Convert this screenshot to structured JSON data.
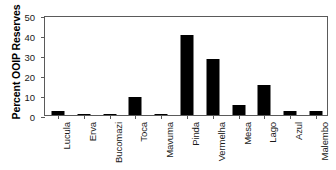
{
  "chart_data": {
    "type": "bar",
    "title": "",
    "xlabel": "",
    "ylabel": "Percent OOIP Reserves",
    "ylim": [
      0,
      50
    ],
    "yticks": [
      0,
      10,
      20,
      30,
      40,
      50
    ],
    "grid": false,
    "legend": null,
    "bar_color": "#000000",
    "axis_color": "#5a5a5a",
    "background": "#ffffff",
    "categories": [
      "Lucula",
      "Erva",
      "Bucomazi",
      "Toca",
      "Mavuma",
      "Pinda",
      "Vermelha",
      "Mesa",
      "Lago",
      "Azul",
      "Malembo"
    ],
    "values": [
      2,
      0.3,
      0.3,
      9,
      0.3,
      40,
      28,
      5,
      15,
      2,
      2
    ]
  }
}
